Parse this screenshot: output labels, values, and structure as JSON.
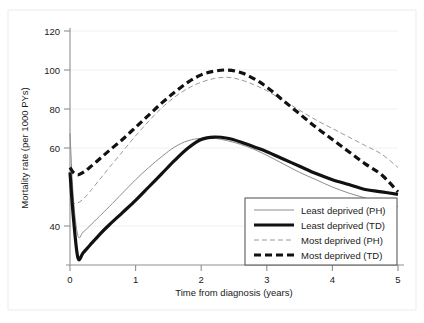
{
  "figure": {
    "background_color": "#ffffff",
    "plot_area_background": "#ffffff",
    "outer_frame_color": "#e6e6e6",
    "axis_color": "#8a8a8a",
    "grid_color": "#efefef"
  },
  "chart_data": {
    "type": "line",
    "title": "",
    "xlabel": "Time from diagnosis (years)",
    "ylabel": "Mortality rate (per 1000 PYs)",
    "xlim": [
      0,
      5
    ],
    "ylim": [
      28,
      124
    ],
    "xticks": [
      "0",
      "1",
      "2",
      "3",
      "4",
      "5"
    ],
    "xtick_values": [
      0,
      1,
      2,
      3,
      4,
      5
    ],
    "yticks": [
      "40",
      "60",
      "80",
      "100",
      "120"
    ],
    "ytick_values": [
      40,
      60,
      80,
      100,
      120
    ],
    "grid": true,
    "grid_axis": "y",
    "legend_position": "lower right",
    "x": [
      0,
      0.05,
      0.12,
      0.2,
      0.3,
      0.45,
      0.6,
      0.8,
      1.0,
      1.2,
      1.4,
      1.6,
      1.8,
      2.0,
      2.2,
      2.4,
      2.6,
      2.8,
      3.0,
      3.25,
      3.5,
      3.75,
      4.0,
      4.25,
      4.5,
      4.75,
      5.0
    ],
    "series": [
      {
        "name": "Least deprived (PH)",
        "style": "solid",
        "width": "thin",
        "color": "#8c8c8c",
        "values": [
          82,
          56,
          40,
          41.5,
          44,
          48,
          52,
          57.5,
          63,
          68,
          72.5,
          76.5,
          79,
          80,
          80,
          79,
          77.5,
          75.5,
          73,
          69.5,
          66,
          63,
          60,
          57.5,
          55.5,
          53.5,
          52
        ]
      },
      {
        "name": "Least deprived (TD)",
        "style": "solid",
        "width": "thick",
        "color": "#111111",
        "values": [
          66,
          48,
          31,
          33,
          36,
          40.5,
          44.5,
          49.5,
          54.5,
          60,
          65.5,
          71,
          76,
          79.5,
          80.5,
          80,
          78.5,
          76.5,
          74.5,
          71.5,
          68.5,
          65.5,
          63,
          61,
          59,
          58,
          57
        ]
      },
      {
        "name": "Most deprived (PH)",
        "style": "dashed",
        "width": "thin",
        "color": "#9a9a9a",
        "values": [
          53,
          53.2,
          53.5,
          55,
          58,
          63,
          68,
          74.5,
          81,
          87,
          92.5,
          97,
          100.5,
          103,
          104.5,
          105,
          104,
          102,
          99.5,
          95.5,
          91.5,
          87.5,
          84,
          80.5,
          77,
          73.5,
          68
        ]
      },
      {
        "name": "Most deprived (TD)",
        "style": "dashed",
        "width": "thick",
        "color": "#111111",
        "values": [
          68,
          66,
          65,
          66,
          68,
          71.5,
          75,
          79.5,
          84.5,
          89.5,
          94.5,
          99,
          103,
          106,
          107.5,
          108,
          107,
          104.5,
          101,
          95.5,
          90,
          84.5,
          79.5,
          74.5,
          69.5,
          65,
          58
        ]
      }
    ]
  },
  "legend": {
    "items": [
      {
        "label": "Least deprived (PH)",
        "style": "solid-thin"
      },
      {
        "label": "Least deprived (TD)",
        "style": "solid-thick"
      },
      {
        "label": "Most deprived (PH)",
        "style": "dashed-thin"
      },
      {
        "label": "Most deprived (TD)",
        "style": "dashed-thick"
      }
    ]
  }
}
